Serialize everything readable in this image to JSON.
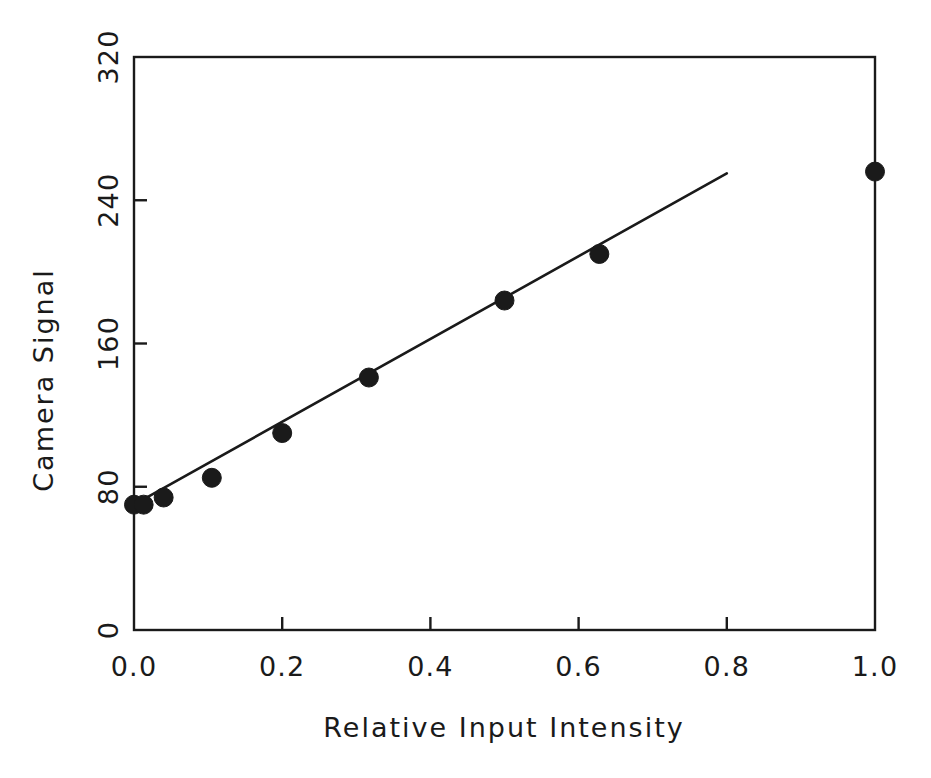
{
  "chart_data": {
    "type": "scatter",
    "title": "",
    "xlabel": "Relative Input Intensity",
    "ylabel": "Camera Signal",
    "xlim": [
      0.0,
      1.0
    ],
    "ylim": [
      0,
      320
    ],
    "xticks": [
      "0.0",
      "0.2",
      "0.4",
      "0.6",
      "0.8",
      "1.0"
    ],
    "xtick_values": [
      0.0,
      0.2,
      0.4,
      0.6,
      0.8,
      1.0
    ],
    "yticks": [
      "0",
      "80",
      "160",
      "240",
      "320"
    ],
    "ytick_values": [
      0,
      80,
      160,
      240,
      320
    ],
    "grid": false,
    "legend": null,
    "tick_direction": "in",
    "frame": "box",
    "marker": "filled-circle",
    "marker_color": "#1a1a1a",
    "line_color": "#1a1a1a",
    "series": [
      {
        "name": "Camera response",
        "kind": "scatter",
        "x": [
          0.0,
          0.013,
          0.04,
          0.105,
          0.2,
          0.317,
          0.5,
          0.628,
          1.0
        ],
        "y": [
          70,
          70,
          74,
          85,
          110,
          141,
          184,
          210,
          256
        ]
      },
      {
        "name": "Linear fit",
        "kind": "line",
        "x": [
          0.0,
          0.8
        ],
        "y": [
          70,
          255
        ]
      }
    ]
  },
  "ylabel_text": "Camera Signal",
  "xlabel_text": "Relative Input Intensity"
}
